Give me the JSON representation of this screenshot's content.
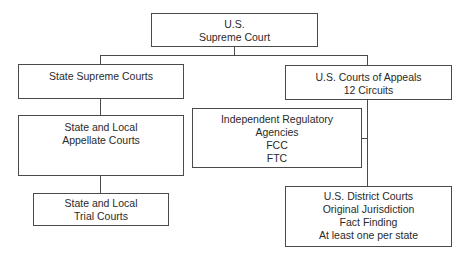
{
  "diagram": {
    "nodes": {
      "supreme_court": {
        "lines": [
          "U.S.",
          "Supreme Court"
        ]
      },
      "state_supreme": {
        "lines": [
          "State Supreme Courts"
        ]
      },
      "appeals": {
        "lines": [
          "U.S. Courts of Appeals",
          "12 Circuits"
        ]
      },
      "state_appellate": {
        "lines": [
          "State and Local",
          "Appellate Courts"
        ]
      },
      "regulatory": {
        "lines": [
          "Independent Regulatory",
          "Agencies",
          "FCC",
          "FTC"
        ]
      },
      "trial": {
        "lines": [
          "State and Local",
          "Trial Courts"
        ]
      },
      "district": {
        "lines": [
          "U.S. District Courts",
          "Original Jurisdiction",
          "Fact Finding",
          "At least one per state"
        ]
      }
    },
    "edges": [
      [
        "supreme_court",
        "state_supreme"
      ],
      [
        "supreme_court",
        "appeals"
      ],
      [
        "state_supreme",
        "state_appellate"
      ],
      [
        "state_appellate",
        "trial"
      ],
      [
        "appeals",
        "regulatory"
      ],
      [
        "appeals",
        "district"
      ]
    ],
    "colors": {
      "line": "#4a4a4a",
      "text": "#2a2a2a",
      "background": "#ffffff"
    }
  }
}
